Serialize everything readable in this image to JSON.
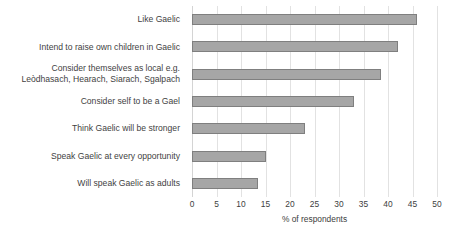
{
  "chart_data": {
    "type": "bar",
    "orientation": "horizontal",
    "title": "",
    "xlabel": "% of respondents",
    "ylabel": "",
    "xlim": [
      0,
      50
    ],
    "xticks": [
      0,
      5,
      10,
      15,
      20,
      25,
      30,
      35,
      40,
      45,
      50
    ],
    "grid": "vertical",
    "legend": "none",
    "bar_color": "#a6a6a6",
    "bar_border_color": "#7f7f7f",
    "categories": [
      "Like Gaelic",
      "Intend to raise own children in Gaelic",
      "Consider themselves as local e.g.\nLeòdhasach, Hearach, Siarach, Sgalpach",
      "Consider self to be a Gael",
      "Think Gaelic will be stronger",
      "Speak Gaelic at every opportunity",
      "Will speak Gaelic as adults"
    ],
    "values": [
      46,
      42,
      38.5,
      33,
      23,
      15,
      13.5
    ]
  }
}
